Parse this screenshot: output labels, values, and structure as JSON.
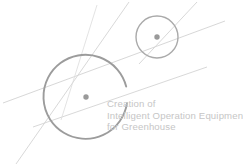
{
  "graphic": {
    "title": "Creation of Intelligent Operation Equipment for Greenhouse logo",
    "background_color": "#ffffff",
    "arc_color": "#9a9a9a",
    "circle_color": "#a8a8a8",
    "line_color": "#cfcfcf",
    "dot_color": "#9a9a9a",
    "text_color": "#c6c6c6",
    "large_arc": {
      "name": "large-open-arc",
      "cx": 86,
      "cy": 97,
      "r": 42,
      "gap_description": "open gap on right side"
    },
    "small_circle": {
      "name": "small-circle",
      "cx": 157,
      "cy": 37,
      "r": 21
    },
    "center_dots": [
      {
        "name": "large-circle-center-dot",
        "cx": 86,
        "cy": 97,
        "r": 2.6
      },
      {
        "name": "small-circle-center-dot",
        "cx": 157,
        "cy": 37,
        "r": 2.6
      }
    ],
    "lines": [
      {
        "name": "tangent-line-upper",
        "x1": 3,
        "y1": 103,
        "x2": 225,
        "y2": 21
      },
      {
        "name": "tangent-line-lower",
        "x1": 33,
        "y1": 127,
        "x2": 205,
        "y2": 68
      },
      {
        "name": "crossing-line-steep",
        "x1": 128,
        "y1": 3,
        "x2": 17,
        "y2": 163
      },
      {
        "name": "crossing-line-diagonal",
        "x1": 140,
        "y1": 62,
        "x2": 196,
        "y2": 3
      },
      {
        "name": "crossing-line-short",
        "x1": 98,
        "y1": 6,
        "x2": 62,
        "y2": 118
      }
    ]
  },
  "tagline": {
    "line_1": "Creation of",
    "line_2": "Intelligent Operation Equipment",
    "line_3": "for Greenhouse"
  }
}
